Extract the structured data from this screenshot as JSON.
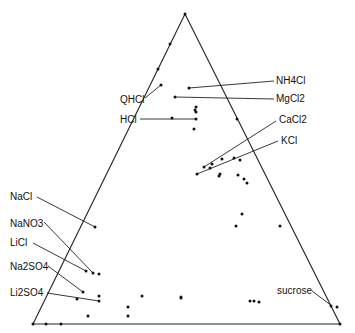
{
  "chart_data": {
    "type": "scatter",
    "subtype": "ternary",
    "title": "",
    "triangle": {
      "apex": [
        185,
        14
      ],
      "bottom_left": [
        33,
        324
      ],
      "bottom_right": [
        340,
        324
      ]
    },
    "labels": [
      {
        "text": "NH4Cl",
        "x": 276,
        "y": 84,
        "anchor": "start",
        "line": [
          [
            274,
            81
          ],
          [
            189,
            88
          ]
        ]
      },
      {
        "text": "MgCl2",
        "x": 276,
        "y": 102,
        "anchor": "start",
        "line": [
          [
            274,
            99
          ],
          [
            175,
            97
          ]
        ]
      },
      {
        "text": "QHCl",
        "x": 120,
        "y": 103,
        "anchor": "start",
        "line": [
          [
            145,
            98
          ],
          [
            161,
            85
          ]
        ]
      },
      {
        "text": "HCl",
        "x": 120,
        "y": 123,
        "anchor": "start",
        "line": [
          [
            140,
            119
          ],
          [
            196,
            119
          ]
        ]
      },
      {
        "text": "CaCl2",
        "x": 279,
        "y": 123,
        "anchor": "start",
        "line": [
          [
            276,
            121
          ],
          [
            204,
            167
          ]
        ]
      },
      {
        "text": "KCl",
        "x": 281,
        "y": 144,
        "anchor": "start",
        "line": [
          [
            278,
            141
          ],
          [
            197,
            174
          ]
        ]
      },
      {
        "text": "NaCl",
        "x": 10,
        "y": 200,
        "anchor": "start",
        "line": [
          [
            37,
            197
          ],
          [
            95,
            227
          ]
        ]
      },
      {
        "text": "NaNO3",
        "x": 10,
        "y": 227,
        "anchor": "start",
        "line": [
          [
            44,
            222
          ],
          [
            93,
            273
          ]
        ]
      },
      {
        "text": "LiCl",
        "x": 10,
        "y": 246,
        "anchor": "start",
        "line": [
          [
            33,
            243
          ],
          [
            86,
            271
          ]
        ]
      },
      {
        "text": "Na2SO4",
        "x": 10,
        "y": 270,
        "anchor": "start",
        "line": [
          [
            48,
            266
          ],
          [
            83,
            292
          ]
        ]
      },
      {
        "text": "Li2SO4",
        "x": 10,
        "y": 296,
        "anchor": "start",
        "line": [
          [
            47,
            293
          ],
          [
            99,
            301
          ]
        ]
      },
      {
        "text": "sucrose",
        "x": 277,
        "y": 294,
        "anchor": "start",
        "line": [
          [
            312,
            291
          ],
          [
            332,
            306
          ]
        ]
      }
    ],
    "points": [
      [
        185,
        14
      ],
      [
        170,
        44
      ],
      [
        158,
        69
      ],
      [
        161,
        85
      ],
      [
        189,
        88
      ],
      [
        175,
        97
      ],
      [
        196,
        107
      ],
      [
        195,
        110
      ],
      [
        196,
        112
      ],
      [
        196,
        119
      ],
      [
        172,
        118
      ],
      [
        194,
        129
      ],
      [
        237,
        119
      ],
      [
        204,
        167
      ],
      [
        197,
        174
      ],
      [
        219,
        176
      ],
      [
        220,
        174
      ],
      [
        212,
        164
      ],
      [
        210,
        168
      ],
      [
        222,
        159
      ],
      [
        234,
        158
      ],
      [
        240,
        160
      ],
      [
        238,
        175
      ],
      [
        244,
        179
      ],
      [
        247,
        183
      ],
      [
        242,
        214
      ],
      [
        236,
        226
      ],
      [
        280,
        226
      ],
      [
        95,
        227
      ],
      [
        86,
        271
      ],
      [
        93,
        273
      ],
      [
        99,
        274
      ],
      [
        83,
        292
      ],
      [
        99,
        296
      ],
      [
        77,
        299
      ],
      [
        99,
        301
      ],
      [
        142,
        296
      ],
      [
        181,
        297
      ],
      [
        128,
        307
      ],
      [
        128,
        316
      ],
      [
        88,
        316
      ],
      [
        181,
        298
      ],
      [
        250,
        301
      ],
      [
        254,
        301
      ],
      [
        259,
        302
      ],
      [
        331,
        306
      ],
      [
        337,
        307
      ],
      [
        340,
        324
      ],
      [
        33,
        324
      ],
      [
        46,
        324
      ],
      [
        61,
        324
      ]
    ],
    "xlabel": "",
    "ylabel": "",
    "grid": false,
    "legend": null
  }
}
